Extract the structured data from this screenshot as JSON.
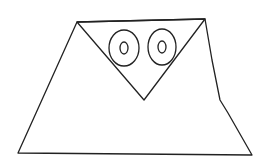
{
  "drawing": {
    "description": "Line drawing of an owl made from a trapezoid body, an inverted triangle face and two concentric oval eyes",
    "stroke_color": "#222222",
    "background": "#ffffff",
    "body": {
      "points": "77,22 205,19 212,60 220,100 228,113 252,155 18,153"
    },
    "face_triangle": {
      "points": "77,22 205,19 144,100"
    },
    "eyes": [
      {
        "cx": 124,
        "cy": 48,
        "outer_rx": 15,
        "outer_ry": 18,
        "inner_rx": 4,
        "inner_ry": 6
      },
      {
        "cx": 162,
        "cy": 47,
        "outer_rx": 14,
        "outer_ry": 18,
        "inner_rx": 4,
        "inner_ry": 6
      }
    ]
  }
}
